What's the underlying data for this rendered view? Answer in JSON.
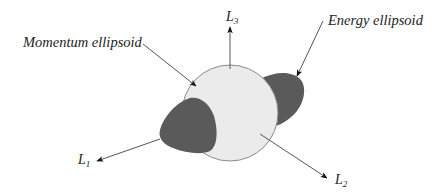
{
  "diagram": {
    "labels": {
      "momentum": "Momentum ellipsoid",
      "energy": "Energy ellipsoid"
    },
    "axes": [
      {
        "id": "L1",
        "main": "L",
        "sub": "1"
      },
      {
        "id": "L2",
        "main": "L",
        "sub": "2"
      },
      {
        "id": "L3",
        "main": "L",
        "sub": "3"
      }
    ],
    "colors": {
      "sphere_fill": "#ebebeb",
      "sphere_stroke": "#8a8a8a",
      "lobe_fill": "#5a5a5a",
      "line": "#555555",
      "text": "#222222"
    }
  }
}
